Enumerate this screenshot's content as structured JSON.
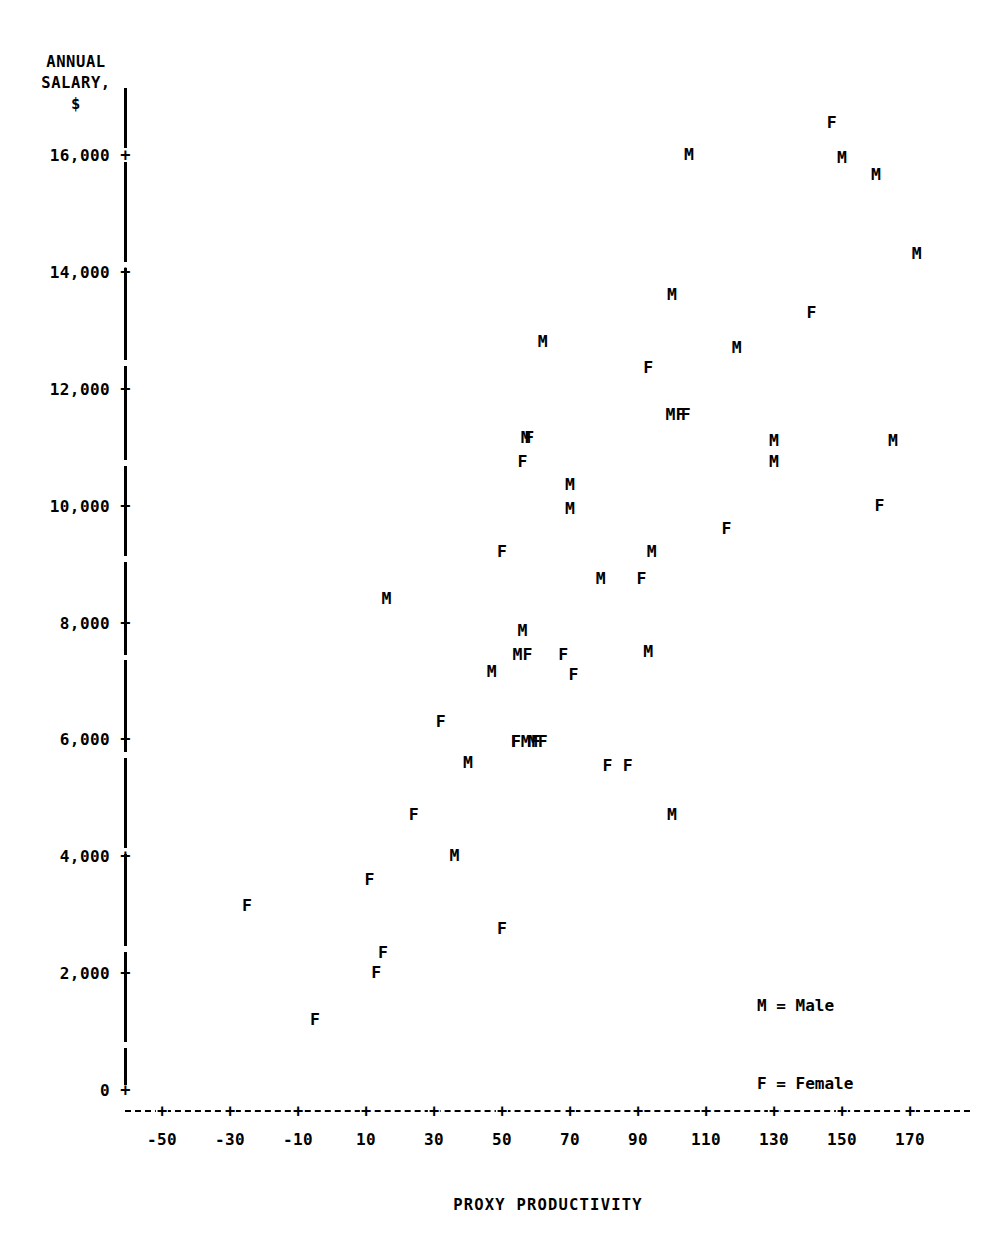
{
  "chart_data": {
    "type": "scatter",
    "title": "",
    "xlabel": "PROXY PRODUCTIVITY",
    "ylabel": "ANNUAL SALARY, $",
    "ylabel_lines": [
      "ANNUAL",
      "SALARY,",
      "$"
    ],
    "xlim": [
      -58,
      178
    ],
    "ylim": [
      0,
      16800
    ],
    "grid": false,
    "legend_position": "lower-right",
    "legend": [
      {
        "marker": "M",
        "label": "M = Male"
      },
      {
        "marker": "F",
        "label": "F = Female"
      }
    ],
    "xticks": [
      -50,
      -30,
      -10,
      10,
      30,
      50,
      70,
      90,
      110,
      130,
      150,
      170
    ],
    "xtick_labels": [
      "-50",
      "-30",
      "-10",
      "10",
      "30",
      "50",
      "70",
      "90",
      "110",
      "130",
      "150",
      "170"
    ],
    "yticks": [
      0,
      2000,
      4000,
      6000,
      8000,
      10000,
      12000,
      14000,
      16000
    ],
    "ytick_labels": [
      "0",
      "2,000",
      "4,000",
      "6,000",
      "8,000",
      "10,000",
      "12,000",
      "14,000",
      "16,000"
    ],
    "series": [
      {
        "name": "Male",
        "marker": "M",
        "points": [
          {
            "x": 16,
            "y": 8400
          },
          {
            "x": 36,
            "y": 4000
          },
          {
            "x": 40,
            "y": 5600
          },
          {
            "x": 47,
            "y": 7150
          },
          {
            "x": 56,
            "y": 7850
          },
          {
            "x": 56,
            "y": 7450
          },
          {
            "x": 57,
            "y": 11150
          },
          {
            "x": 62,
            "y": 12800
          },
          {
            "x": 59,
            "y": 5950
          },
          {
            "x": 70,
            "y": 10350
          },
          {
            "x": 70,
            "y": 9950
          },
          {
            "x": 79,
            "y": 8750
          },
          {
            "x": 94,
            "y": 9200
          },
          {
            "x": 93,
            "y": 7500
          },
          {
            "x": 101,
            "y": 11550
          },
          {
            "x": 100,
            "y": 13600
          },
          {
            "x": 105,
            "y": 16000
          },
          {
            "x": 100,
            "y": 4700
          },
          {
            "x": 119,
            "y": 12700
          },
          {
            "x": 130,
            "y": 11100
          },
          {
            "x": 130,
            "y": 10750
          },
          {
            "x": 150,
            "y": 15950
          },
          {
            "x": 160,
            "y": 15650
          },
          {
            "x": 165,
            "y": 11100
          },
          {
            "x": 172,
            "y": 14300
          }
        ]
      },
      {
        "name": "Female",
        "marker": "F",
        "points": [
          {
            "x": -25,
            "y": 3150
          },
          {
            "x": -5,
            "y": 1200
          },
          {
            "x": 11,
            "y": 3600
          },
          {
            "x": 15,
            "y": 2350
          },
          {
            "x": 13,
            "y": 2000
          },
          {
            "x": 24,
            "y": 4700
          },
          {
            "x": 32,
            "y": 6300
          },
          {
            "x": 50,
            "y": 2750
          },
          {
            "x": 50,
            "y": 9200
          },
          {
            "x": 54,
            "y": 5950
          },
          {
            "x": 62,
            "y": 5950
          },
          {
            "x": 56,
            "y": 10750
          },
          {
            "x": 58,
            "y": 11150
          },
          {
            "x": 68,
            "y": 7450
          },
          {
            "x": 71,
            "y": 7100
          },
          {
            "x": 81,
            "y": 5550
          },
          {
            "x": 87,
            "y": 5550
          },
          {
            "x": 91,
            "y": 8750
          },
          {
            "x": 93,
            "y": 12350
          },
          {
            "x": 104,
            "y": 11550
          },
          {
            "x": 116,
            "y": 9600
          },
          {
            "x": 141,
            "y": 13300
          },
          {
            "x": 147,
            "y": 16550
          },
          {
            "x": 161,
            "y": 10000
          }
        ]
      }
    ],
    "overlapping_labels": [
      {
        "x": 56,
        "y": 7450,
        "text": "MF"
      },
      {
        "x": 101,
        "y": 11550,
        "text": "MF"
      },
      {
        "x": 57,
        "y": 5950,
        "text": "FMF"
      }
    ]
  }
}
